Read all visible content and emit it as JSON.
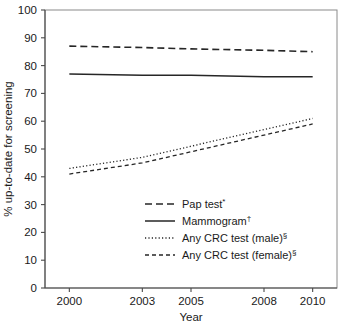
{
  "chart_data": {
    "type": "line",
    "title": "",
    "xlabel": "Year",
    "ylabel": "% up-to-date for screening",
    "x": [
      2000,
      2003,
      2005,
      2008,
      2010
    ],
    "xticks": [
      "2000",
      "2003",
      "2005",
      "2008",
      "2010"
    ],
    "xlim": [
      1999,
      2011
    ],
    "ylim": [
      0,
      100
    ],
    "yticks": [
      "0",
      "10",
      "20",
      "30",
      "40",
      "50",
      "60",
      "70",
      "80",
      "90",
      "100"
    ],
    "ytick_values": [
      0,
      10,
      20,
      30,
      40,
      50,
      60,
      70,
      80,
      90,
      100
    ],
    "grid": false,
    "legend_position": "inside-lower-center",
    "series": [
      {
        "name": "Pap test",
        "marker_symbol": "*",
        "legend_label": "Pap test",
        "line_style": "long-dash",
        "color": "#262626",
        "values": [
          87,
          86.5,
          86,
          85.5,
          85
        ]
      },
      {
        "name": "Mammogram",
        "marker_symbol": "†",
        "legend_label": "Mammogram",
        "line_style": "solid",
        "color": "#262626",
        "values": [
          77,
          76.5,
          76.5,
          76,
          76
        ]
      },
      {
        "name": "Any CRC test (male)",
        "marker_symbol": "§",
        "legend_label": "Any CRC test (male)",
        "line_style": "dotted",
        "color": "#262626",
        "values": [
          43,
          47,
          51,
          57,
          61
        ]
      },
      {
        "name": "Any CRC test (female)",
        "marker_symbol": "§",
        "legend_label": "Any CRC test (female)",
        "line_style": "short-dash",
        "color": "#262626",
        "values": [
          41,
          45,
          49,
          55,
          59
        ]
      }
    ]
  }
}
